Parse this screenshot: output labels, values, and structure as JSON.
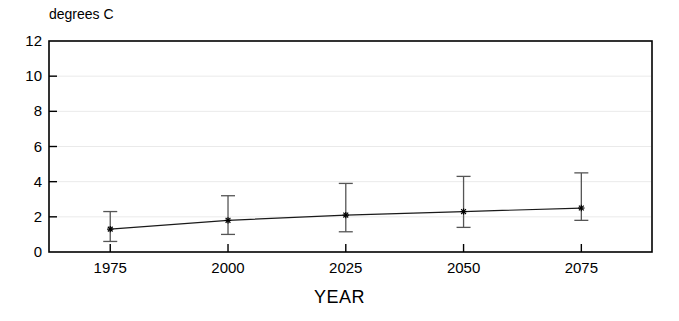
{
  "chart_data": {
    "type": "line",
    "title": "",
    "subtitle": "",
    "xlabel": "YEAR",
    "ylabel": "degrees C",
    "ylabel_position": "above-axis",
    "categories": [
      "1975",
      "2000",
      "2025",
      "2050",
      "2075"
    ],
    "x": [
      1975,
      2000,
      2025,
      2050,
      2075
    ],
    "xlim": [
      1962,
      1975,
      2000,
      2025,
      2050,
      2075,
      2090
    ],
    "xlim_range": [
      1962,
      2090
    ],
    "ylim": [
      0,
      12
    ],
    "ytick_labels": [
      "0",
      "2",
      "4",
      "6",
      "8",
      "10",
      "12"
    ],
    "yticks": [
      0,
      2,
      4,
      6,
      8,
      10,
      12
    ],
    "xtick_labels": [
      "1975",
      "2000",
      "2025",
      "2050",
      "2075"
    ],
    "grid": "horizontal-faint",
    "legend": "none",
    "marker": "asterisk",
    "error_bars": true,
    "series": [
      {
        "name": "projected warming",
        "values": [
          1.3,
          1.8,
          2.1,
          2.3,
          2.5
        ],
        "upper": [
          2.3,
          3.2,
          3.9,
          4.3,
          4.5
        ],
        "lower": [
          0.6,
          1.0,
          1.15,
          1.4,
          1.8
        ]
      }
    ],
    "colors": {
      "line": "#1a1a1a",
      "marker": "#000000",
      "error_bar": "#555555",
      "axis": "#000000",
      "grid": "#eaeaea",
      "background": "#ffffff"
    }
  },
  "labels": {
    "y_unit": "degrees C",
    "x_axis_title": "YEAR"
  }
}
